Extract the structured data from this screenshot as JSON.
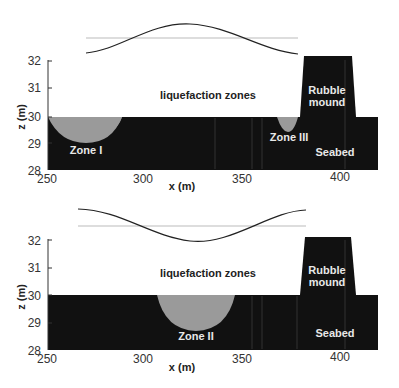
{
  "figure": {
    "panels": [
      {
        "id": "top",
        "ylabel": "z (m)",
        "xlabel": "x (m)",
        "yticks": [
          "32",
          "31",
          "30",
          "29",
          "28"
        ],
        "xticks": [
          "250",
          "300",
          "350",
          "400"
        ],
        "annotation": "liquefaction zones",
        "zones": [
          "Zone I",
          "Zone III"
        ],
        "rubble_label": [
          "Rubble",
          "mound"
        ],
        "seabed_label": "Seabed"
      },
      {
        "id": "bottom",
        "ylabel": "z (m)",
        "xlabel": "x (m)",
        "yticks": [
          "32",
          "31",
          "30",
          "29",
          "28"
        ],
        "xticks": [
          "250",
          "300",
          "350",
          "400"
        ],
        "annotation": "liquefaction zones",
        "zones": [
          "Zone II"
        ],
        "rubble_label": [
          "Rubble",
          "mound"
        ],
        "seabed_label": "Seabed"
      }
    ]
  },
  "colors": {
    "seabed": "#111111",
    "zone": "#9a9a9a",
    "wave": "#222222",
    "mwl": "#bbbbbb"
  }
}
